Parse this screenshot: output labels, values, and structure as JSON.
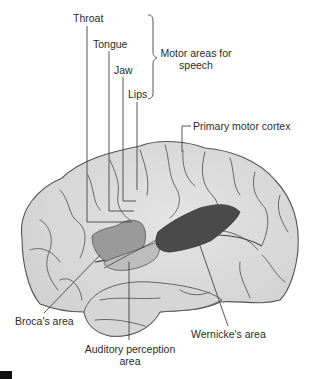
{
  "figure": {
    "type": "lateral view of left cerebral hemisphere",
    "colors": {
      "cortex_fill": "#dcdcdc",
      "cortex_light": "#e9e9e9",
      "sulcus_line": "#555555",
      "broca_fill": "#9a9a9a",
      "auditory_fill": "#bdbdbd",
      "wernicke_fill": "#4a4a4a",
      "leader_line": "#444444"
    }
  },
  "labels": {
    "throat": "Throat",
    "tongue": "Tongue",
    "jaw": "Jaw",
    "lips": "Lips",
    "motor_areas_line1": "Motor areas for",
    "motor_areas_line2": "speech",
    "primary_motor_cortex": "Primary motor cortex",
    "brocas_area": "Broca's area",
    "wernickes_area": "Wernicke's area",
    "auditory_line1": "Auditory perception",
    "auditory_line2": "area"
  }
}
